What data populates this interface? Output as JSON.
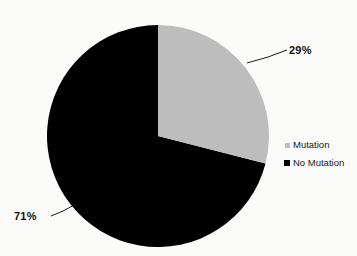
{
  "background_color": "#fbfbfa",
  "chart_data": {
    "type": "pie",
    "title": "",
    "subtitle": "",
    "xlabel": "",
    "ylabel": "",
    "grid": false,
    "legend_position": "right",
    "start_angle_deg": 0,
    "direction": "clockwise",
    "total_percent": 100,
    "categories": [
      "Mutation",
      "No Mutation"
    ],
    "values": [
      29,
      71
    ],
    "value_unit": "%",
    "colors": [
      "#bdbdbd",
      "#000000"
    ],
    "slices": [
      {
        "label": "Mutation",
        "value": 29,
        "value_label": "29%",
        "color": "#bdbdbd",
        "sweep_deg": 104.4,
        "start_deg": 0,
        "end_deg": 104.4
      },
      {
        "label": "No Mutation",
        "value": 71,
        "value_label": "71%",
        "color": "#000000",
        "sweep_deg": 255.6,
        "start_deg": 104.4,
        "end_deg": 360
      }
    ],
    "data_labels": [
      {
        "text": "29%",
        "slice": "Mutation",
        "placement": "outside-right-top",
        "leader_line": true
      },
      {
        "text": "71%",
        "slice": "No Mutation",
        "placement": "outside-left-bottom",
        "leader_line": true
      }
    ]
  },
  "legend": {
    "items": [
      {
        "label": "Mutation",
        "swatch_color": "#bdbdbd",
        "marker": "square-marker"
      },
      {
        "label": "No Mutation",
        "swatch_color": "#000000",
        "marker": "square-marker"
      }
    ]
  }
}
